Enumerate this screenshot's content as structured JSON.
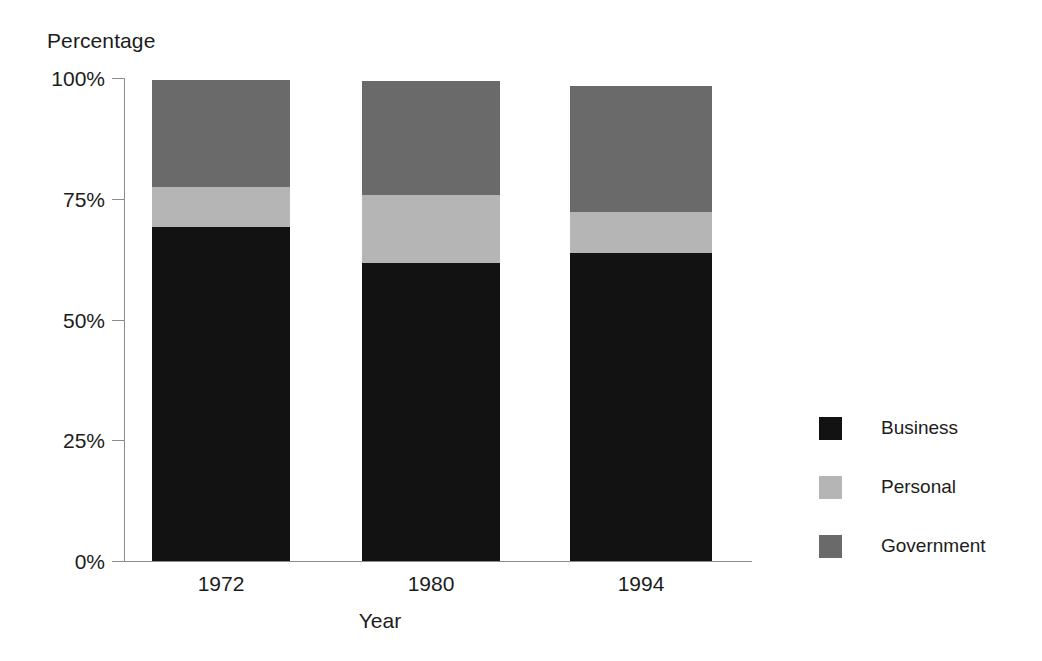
{
  "chart_data": {
    "type": "bar",
    "subtype": "stacked-bar-100-percent",
    "title": "",
    "xlabel": "Year",
    "ylabel": "Percentage",
    "categories": [
      "1972",
      "1980",
      "1994"
    ],
    "ylim": [
      0,
      100
    ],
    "ytick_labels": [
      "0%",
      "25%",
      "50%",
      "75%",
      "100%"
    ],
    "ytick_values": [
      0,
      25,
      50,
      75,
      100
    ],
    "grid": false,
    "legend_position": "right",
    "series": [
      {
        "name": "Business",
        "color": "#121212",
        "values": [
          69.2,
          61.8,
          63.8
        ]
      },
      {
        "name": "Personal",
        "color": "#b5b5b5",
        "values": [
          8.3,
          14.0,
          8.5
        ]
      },
      {
        "name": "Government",
        "color": "#6a6a6a",
        "values": [
          22.1,
          23.6,
          26.0
        ]
      }
    ],
    "stack_tops": [
      99.6,
      99.4,
      98.3
    ],
    "boundaries": {
      "business_top": [
        69.2,
        61.8,
        63.8
      ],
      "personal_top": [
        77.5,
        75.8,
        72.3
      ],
      "government_top": [
        99.6,
        99.4,
        98.3
      ]
    },
    "axis_color": "#8c8c8c",
    "background": "#ffffff"
  },
  "legend": {
    "items": [
      {
        "label": "Business",
        "color": "#121212"
      },
      {
        "label": "Personal",
        "color": "#b5b5b5"
      },
      {
        "label": "Government",
        "color": "#6a6a6a"
      }
    ]
  }
}
